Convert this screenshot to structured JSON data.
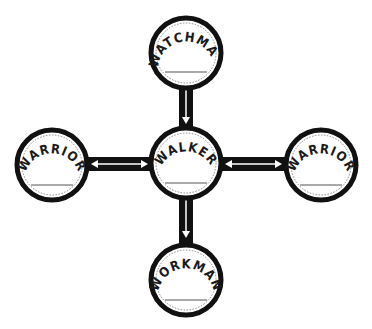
{
  "diagram": {
    "type": "hub-and-spoke",
    "colors": {
      "ring": "#111111",
      "fill": "#ffffff",
      "arrow": "#ffffff",
      "dashed": "#777777",
      "line": "#555555"
    },
    "nodes": [
      {
        "id": "top",
        "label": "WATCHMAN",
        "cx": 186,
        "cy": 53,
        "r": 37
      },
      {
        "id": "center",
        "label": "WALKER",
        "cx": 186,
        "cy": 163,
        "r": 37
      },
      {
        "id": "left",
        "label": "WARRIOR",
        "cx": 52,
        "cy": 165,
        "r": 37
      },
      {
        "id": "right",
        "label": "WARRIOR",
        "cx": 321,
        "cy": 165,
        "r": 37
      },
      {
        "id": "bottom",
        "label": "WORKMAN",
        "cx": 186,
        "cy": 280,
        "r": 37
      }
    ],
    "connectors": [
      {
        "from": "top",
        "to": "center",
        "direction": "down"
      },
      {
        "from": "center",
        "to": "bottom",
        "direction": "down"
      },
      {
        "from": "left",
        "to": "center",
        "direction": "both"
      },
      {
        "from": "center",
        "to": "right",
        "direction": "both"
      }
    ]
  }
}
